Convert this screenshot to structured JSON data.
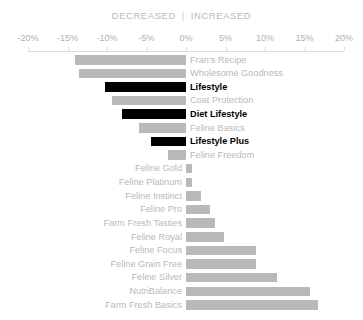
{
  "header": {
    "left_label": "DECREASED",
    "divider": "|",
    "right_label": "INCREASED"
  },
  "axis": {
    "ticks": [
      {
        "value": -20,
        "label": "-20%"
      },
      {
        "value": -15,
        "label": "-15%"
      },
      {
        "value": -10,
        "label": "-10%"
      },
      {
        "value": -5,
        "label": "-5%"
      },
      {
        "value": 0,
        "label": "0%"
      },
      {
        "value": 5,
        "label": "5%"
      },
      {
        "value": 10,
        "label": "10%"
      },
      {
        "value": 15,
        "label": "15%"
      },
      {
        "value": 20,
        "label": "20%"
      }
    ]
  },
  "colors": {
    "bar": "#b9b9b9",
    "bar_highlight": "#000000",
    "label": "#b9b9b9",
    "label_highlight": "#000000",
    "axis": "#dcdcdc",
    "background": "#ffffff"
  },
  "chart_data": {
    "type": "bar",
    "orientation": "horizontal",
    "title": "",
    "subtitle": "DECREASED | INCREASED",
    "xlabel": "",
    "ylabel": "",
    "xlim": [
      -20,
      20
    ],
    "xticks": [
      -20,
      -15,
      -10,
      -5,
      0,
      5,
      10,
      15,
      20
    ],
    "xtick_labels": [
      "-20%",
      "-15%",
      "-10%",
      "-5%",
      "0%",
      "5%",
      "10%",
      "15%",
      "20%"
    ],
    "grid": false,
    "legend": false,
    "categories": [
      "Fran's Recipe",
      "Wholesome Goodness",
      "Lifestyle",
      "Coat Protection",
      "Diet Lifestyle",
      "Feline Basics",
      "Lifestyle Plus",
      "Feline Freedom",
      "Feline Gold",
      "Feline Platinum",
      "Feline Instinct",
      "Feline Pro",
      "Farm Fresh Tasties",
      "Feline Royal",
      "Feline Focus",
      "Feline Grain Free",
      "Feline Silver",
      "NutriBalance",
      "Farm Fresh Basics"
    ],
    "values": [
      -14.0,
      -13.5,
      -10.3,
      -9.4,
      -8.1,
      -6.0,
      -4.4,
      -2.3,
      0.8,
      0.8,
      1.9,
      3.1,
      3.7,
      4.8,
      8.9,
      8.9,
      11.5,
      15.7,
      16.7
    ],
    "highlighted": [
      "Lifestyle",
      "Diet Lifestyle",
      "Lifestyle Plus"
    ]
  }
}
